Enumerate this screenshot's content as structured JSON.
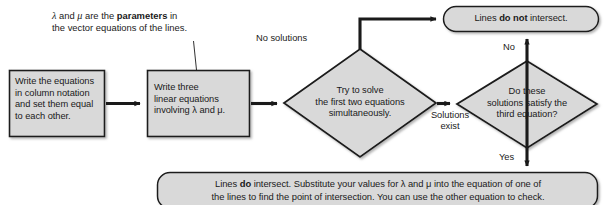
{
  "diagram": {
    "colors": {
      "node_fill": "#d9d9d9",
      "node_stroke": "#1a1a1a",
      "arrow": "#1a1a1a",
      "text": "#1a1a1a",
      "background": "#ffffff"
    },
    "annotations": [
      {
        "name": "parameters-note",
        "line1_pre": "λ",
        "line1_mid": " and ",
        "line1_var2": "μ",
        "line1_post": " are the ",
        "line1_bold": "parameters",
        "line1_tail": " in",
        "line2": "the vector equations of the lines."
      }
    ],
    "nodes": [
      {
        "id": "write-equations",
        "shape": "rect",
        "lines": [
          "Write the equations",
          "in column notation",
          "and set them equal",
          "to each other."
        ]
      },
      {
        "id": "write-three-linear",
        "shape": "rect",
        "lines": [
          "Write three",
          "linear equations",
          "involving λ and μ."
        ]
      },
      {
        "id": "try-to-solve",
        "shape": "diamond",
        "lines": [
          "Try to solve",
          "the first two equations",
          "simultaneously."
        ]
      },
      {
        "id": "satisfy-third-equation",
        "shape": "diamond",
        "lines": [
          "Do these",
          "solutions satisfy the",
          "third equation?"
        ]
      },
      {
        "id": "lines-do-not-intersect",
        "shape": "rounded",
        "text_pre": "Lines ",
        "text_bold": "do not",
        "text_post": " intersect."
      },
      {
        "id": "lines-do-intersect",
        "shape": "rounded",
        "line1_pre": "Lines ",
        "line1_bold": "do",
        "line1_post": " intersect. Substitute your values for λ and μ into the equation of one of",
        "line2": "the lines to find the point of intersection. You can use the other equation to check."
      }
    ],
    "edges": [
      {
        "id": "edge-1",
        "label": "",
        "from": "write-equations",
        "to": "write-three-linear"
      },
      {
        "id": "edge-2",
        "label": "",
        "from": "write-three-linear",
        "to": "try-to-solve"
      },
      {
        "id": "edge-no-solutions",
        "label": "No solutions",
        "from": "try-to-solve",
        "to": "lines-do-not-intersect"
      },
      {
        "id": "edge-solutions-exist",
        "label_line1": "Solutions",
        "label_line2": "exist",
        "from": "try-to-solve",
        "to": "satisfy-third-equation"
      },
      {
        "id": "edge-no",
        "label": "No",
        "from": "satisfy-third-equation",
        "to": "lines-do-not-intersect"
      },
      {
        "id": "edge-yes",
        "label": "Yes",
        "from": "satisfy-third-equation",
        "to": "lines-do-intersect"
      }
    ]
  }
}
